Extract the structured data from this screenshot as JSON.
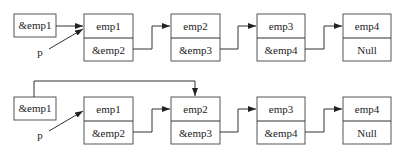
{
  "diagrams": [
    {
      "name": "before-delete",
      "head_pointer": "&emp1",
      "pointer_label": "p",
      "nodes": [
        {
          "data": "emp1",
          "next": "&emp2"
        },
        {
          "data": "emp2",
          "next": "&emp3"
        },
        {
          "data": "emp3",
          "next": "&emp4"
        },
        {
          "data": "emp4",
          "next": "Null"
        }
      ]
    },
    {
      "name": "after-delete",
      "head_pointer": "&emp1",
      "pointer_label": "p",
      "head_points_to": "emp2",
      "nodes": [
        {
          "data": "emp1",
          "next": "&emp2"
        },
        {
          "data": "emp2",
          "next": "&emp3"
        },
        {
          "data": "emp3",
          "next": "&emp4"
        },
        {
          "data": "emp4",
          "next": "Null"
        }
      ]
    }
  ]
}
